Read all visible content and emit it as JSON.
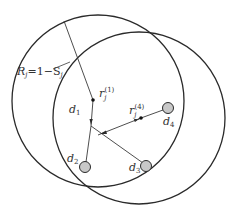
{
  "diagram": {
    "colors": {
      "stroke": "#2a2a2a",
      "node_fill": "#c8c8c8",
      "text": "#333333",
      "background": "#ffffff"
    },
    "circles": [
      {
        "name": "circle-1",
        "cx": 98,
        "cy": 101,
        "r": 86
      },
      {
        "name": "circle-2",
        "cx": 139,
        "cy": 118,
        "r": 86
      }
    ],
    "labels": {
      "radius": {
        "R": "R",
        "sub_j": "j",
        "eq": "=1−S",
        "sub_j2": "j"
      },
      "r1": {
        "r": "r",
        "sub": "j",
        "sup": "(1)"
      },
      "r4": {
        "r": "r",
        "sub": "j",
        "sup": "(4)"
      },
      "d1": {
        "d": "d",
        "sub": "1"
      },
      "d2": {
        "d": "d",
        "sub": "2"
      },
      "d3": {
        "d": "d",
        "sub": "3"
      },
      "d4": {
        "d": "d",
        "sub": "4"
      }
    },
    "points": {
      "r1": [
        93,
        100
      ],
      "r4": [
        141,
        118
      ],
      "junction": [
        91,
        126
      ],
      "d2": [
        85,
        167
      ],
      "d3": [
        146,
        166
      ],
      "d4": [
        167,
        108
      ]
    }
  }
}
